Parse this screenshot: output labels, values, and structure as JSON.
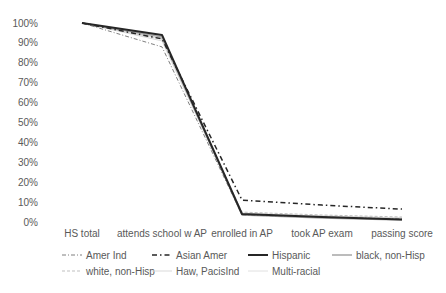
{
  "chart_data": {
    "type": "line",
    "title": "",
    "xlabel": "",
    "ylabel": "",
    "ylim": [
      0,
      100
    ],
    "y_ticks": [
      "0%",
      "10%",
      "20%",
      "30%",
      "40%",
      "50%",
      "60%",
      "70%",
      "80%",
      "90%",
      "100%"
    ],
    "grid": false,
    "legend_position": "bottom",
    "categories": [
      "HS total",
      "attends school w AP",
      "enrolled in AP",
      "took AP exam",
      "passing score"
    ],
    "series": [
      {
        "name": "Amer Ind",
        "values": [
          100,
          88,
          3.5,
          2.5,
          1.5
        ],
        "color": "#7f7f7f",
        "dash": "4,2,1,2",
        "width": 1
      },
      {
        "name": "Asian Amer",
        "values": [
          100,
          92,
          11,
          8.5,
          6.5
        ],
        "color": "#262626",
        "dash": "5,3,1.5,3",
        "width": 1.5
      },
      {
        "name": "Hispanic",
        "values": [
          100,
          94,
          4,
          2.5,
          1.2
        ],
        "color": "#262626",
        "dash": "",
        "width": 2
      },
      {
        "name": "black, non-Hisp",
        "values": [
          100,
          93,
          3.5,
          2,
          1
        ],
        "color": "#a6a6a6",
        "dash": "",
        "width": 1.5
      },
      {
        "name": "white, non-Hisp",
        "values": [
          100,
          92,
          5,
          3.5,
          2.5
        ],
        "color": "#bfbfbf",
        "dash": "3,2",
        "width": 1
      },
      {
        "name": "Haw, PacisInd",
        "values": [
          100,
          91,
          4,
          3,
          2
        ],
        "color": "#d9d9d9",
        "dash": "",
        "width": 1
      },
      {
        "name": "Multi-racial",
        "values": [
          100,
          92,
          4.5,
          3,
          2
        ],
        "color": "#e0e0e0",
        "dash": "",
        "width": 1
      }
    ]
  },
  "legend": [
    {
      "label": "Amer Ind"
    },
    {
      "label": "Asian Amer"
    },
    {
      "label": "Hispanic"
    },
    {
      "label": "black, non-Hisp"
    },
    {
      "label": "white, non-Hisp"
    },
    {
      "label": "Haw, PacisInd"
    },
    {
      "label": "Multi-racial"
    }
  ]
}
